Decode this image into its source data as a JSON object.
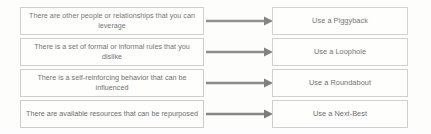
{
  "diagram": {
    "type": "two-column-mapping",
    "title": "",
    "colors": {
      "box_border": "#c2c2c2",
      "box_fill": "#ffffff",
      "text": "#4a4a4a",
      "arrow": "#6e6e6e",
      "background": "#fefefe"
    },
    "rows": [
      {
        "condition": "There are other people or relationships that you can leverage",
        "condition_line1": "There are other people or relationships that",
        "condition_line2": "you can leverage",
        "arrow": "arrow-right",
        "action": "Use a Piggyback"
      },
      {
        "condition": "There is a set of formal or informal rules that you dislike",
        "condition_line1": "There is a set of formal or informal rules that",
        "condition_line2": "you dislike",
        "arrow": "arrow-right",
        "action": "Use a Loophole"
      },
      {
        "condition": "There is a self-reinforcing behavior that can be influenced",
        "condition_line1": "There is a self-reinforcing behavior that can",
        "condition_line2": "be influenced",
        "arrow": "arrow-right",
        "action": "Use a Roundabout"
      },
      {
        "condition": "There are available resources that can be repurposed",
        "condition_line1": "There are available resources that can be",
        "condition_line2": "repurposed",
        "arrow": "arrow-right",
        "action": "Use a Next-Best"
      }
    ]
  }
}
